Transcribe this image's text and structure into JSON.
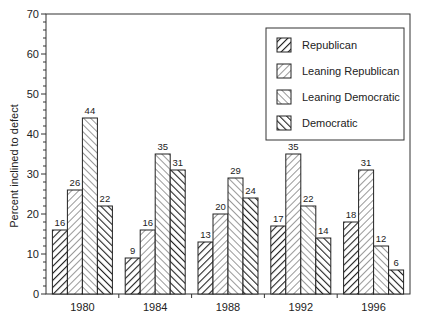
{
  "chart_data": {
    "type": "bar",
    "title": "",
    "xlabel": "",
    "ylabel": "Percent inclined to defect",
    "ylim": [
      0,
      70
    ],
    "yticks": [
      0,
      10,
      20,
      30,
      40,
      50,
      60,
      70
    ],
    "grid": false,
    "legend_position": "upper right (inside plot)",
    "categories": [
      "1980",
      "1984",
      "1988",
      "1992",
      "1996"
    ],
    "series": [
      {
        "name": "Republican",
        "pattern": "dense-backslash-hatch",
        "values": [
          16,
          9,
          13,
          17,
          18
        ]
      },
      {
        "name": "Leaning Republican",
        "pattern": "light-backslash-hatch",
        "values": [
          26,
          16,
          20,
          35,
          31
        ]
      },
      {
        "name": "Leaning Democratic",
        "pattern": "light-slash-hatch",
        "values": [
          44,
          35,
          29,
          22,
          12
        ]
      },
      {
        "name": "Democratic",
        "pattern": "dense-slash-hatch",
        "values": [
          22,
          31,
          24,
          14,
          6
        ]
      }
    ],
    "data_labels": true
  },
  "colors": {
    "ink": "#222222",
    "background": "#ffffff"
  }
}
